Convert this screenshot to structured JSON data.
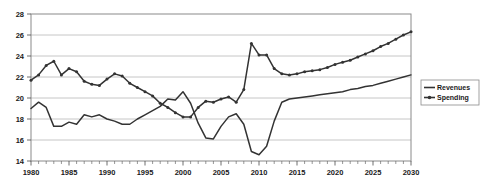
{
  "chart_data": {
    "type": "line",
    "title": "",
    "subtitle": "",
    "xlabel": "",
    "ylabel": "",
    "xlim": [
      1980,
      2030
    ],
    "ylim": [
      14,
      28
    ],
    "ytick_values": [
      14,
      16,
      18,
      20,
      22,
      24,
      26,
      28
    ],
    "ytick_labels": [
      "14",
      "16",
      "18",
      "20",
      "22",
      "24",
      "26",
      "28"
    ],
    "xtick_values": [
      1980,
      1985,
      1990,
      1995,
      2000,
      2005,
      2010,
      2015,
      2020,
      2025,
      2030
    ],
    "xtick_labels": [
      "1980",
      "1985",
      "1990",
      "1995",
      "2000",
      "2005",
      "2010",
      "2015",
      "2020",
      "2025",
      "2030"
    ],
    "x_minor_tick_step": 1,
    "grid": true,
    "grid_axis": "y",
    "legend_position": "right-outside",
    "line_color": "#333333",
    "grid_color": "#b8b8b8",
    "frame_color": "#8a8a8a",
    "x": [
      1980,
      1981,
      1982,
      1983,
      1984,
      1985,
      1986,
      1987,
      1988,
      1989,
      1990,
      1991,
      1992,
      1993,
      1994,
      1995,
      1996,
      1997,
      1998,
      1999,
      2000,
      2001,
      2002,
      2003,
      2004,
      2005,
      2006,
      2007,
      2008,
      2009,
      2010,
      2011,
      2012,
      2013,
      2014,
      2015,
      2016,
      2017,
      2018,
      2019,
      2020,
      2021,
      2022,
      2023,
      2024,
      2025,
      2026,
      2027,
      2028,
      2029,
      2030
    ],
    "series": [
      {
        "name": "Revenues",
        "markers": false,
        "values": [
          19.0,
          19.6,
          19.1,
          17.3,
          17.3,
          17.7,
          17.5,
          18.4,
          18.2,
          18.4,
          18.0,
          17.8,
          17.5,
          17.5,
          18.0,
          18.4,
          18.8,
          19.2,
          19.9,
          19.8,
          20.6,
          19.5,
          17.6,
          16.2,
          16.1,
          17.3,
          18.2,
          18.5,
          17.5,
          14.9,
          14.6,
          15.4,
          17.8,
          19.6,
          19.9,
          20.0,
          20.1,
          20.2,
          20.3,
          20.4,
          20.5,
          20.6,
          20.8,
          20.9,
          21.1,
          21.2,
          21.4,
          21.6,
          21.8,
          22.0,
          22.2
        ]
      },
      {
        "name": "Spending",
        "markers": true,
        "values": [
          21.7,
          22.2,
          23.1,
          23.5,
          22.2,
          22.8,
          22.5,
          21.6,
          21.3,
          21.2,
          21.8,
          22.3,
          22.1,
          21.4,
          21.0,
          20.6,
          20.2,
          19.5,
          19.1,
          18.6,
          18.2,
          18.2,
          19.1,
          19.7,
          19.6,
          19.9,
          20.1,
          19.6,
          20.8,
          25.2,
          24.1,
          24.1,
          22.8,
          22.3,
          22.2,
          22.3,
          22.5,
          22.6,
          22.7,
          22.9,
          23.2,
          23.4,
          23.6,
          23.9,
          24.2,
          24.5,
          24.9,
          25.2,
          25.6,
          26.0,
          26.3
        ]
      }
    ]
  },
  "legend": {
    "entries": [
      {
        "label": "Revenues"
      },
      {
        "label": "Spending"
      }
    ]
  }
}
